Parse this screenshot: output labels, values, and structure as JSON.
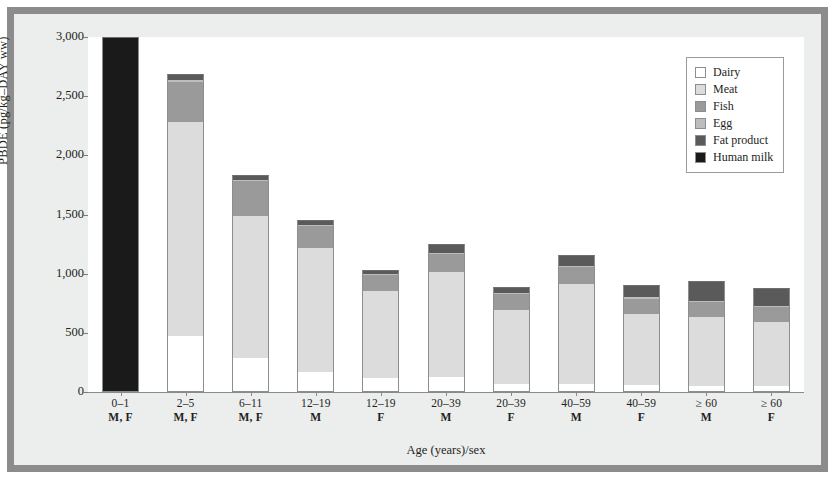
{
  "chart_data": {
    "type": "bar",
    "subtype": "stacked-bar",
    "title": "",
    "xlabel": "Age (years)/sex",
    "ylabel": "PBDE (pg/kg–DAY ww)",
    "ylim": [
      0,
      3000
    ],
    "yticks": [
      0,
      500,
      1000,
      1500,
      2000,
      2500,
      3000
    ],
    "ytick_labels": [
      "0",
      "500",
      "1,000",
      "1,500",
      "2,000",
      "2,500",
      "3,000"
    ],
    "grid": false,
    "legend_position": "top-right",
    "categories": [
      {
        "age": "0–1",
        "sex": "M, F"
      },
      {
        "age": "2–5",
        "sex": "M, F"
      },
      {
        "age": "6–11",
        "sex": "M, F"
      },
      {
        "age": "12–19",
        "sex": "M"
      },
      {
        "age": "12–19",
        "sex": "F"
      },
      {
        "age": "20–39",
        "sex": "M"
      },
      {
        "age": "20–39",
        "sex": "F"
      },
      {
        "age": "40–59",
        "sex": "M"
      },
      {
        "age": "40–59",
        "sex": "F"
      },
      {
        "age": "≥ 60",
        "sex": "M"
      },
      {
        "age": "≥ 60",
        "sex": "F"
      }
    ],
    "series": [
      {
        "name": "Dairy",
        "color": "#ffffff",
        "values": [
          0,
          470,
          290,
          165,
          120,
          125,
          70,
          70,
          60,
          55,
          55
        ]
      },
      {
        "name": "Meat",
        "color": "#dcdcdc",
        "values": [
          0,
          1810,
          1200,
          1050,
          735,
          890,
          625,
          840,
          600,
          575,
          535
        ]
      },
      {
        "name": "Fish",
        "color": "#9a9a9a",
        "values": [
          0,
          340,
          290,
          185,
          130,
          150,
          130,
          145,
          130,
          130,
          130
        ]
      },
      {
        "name": "Egg",
        "color": "#bdbdbd",
        "values": [
          0,
          20,
          15,
          10,
          10,
          10,
          10,
          10,
          10,
          10,
          10
        ]
      },
      {
        "name": "Fat product",
        "color": "#5a5a5a",
        "values": [
          0,
          45,
          40,
          40,
          40,
          75,
          50,
          95,
          105,
          170,
          150
        ]
      },
      {
        "name": "Human milk",
        "color": "#1a1a1a",
        "values": [
          3000,
          0,
          0,
          0,
          0,
          0,
          0,
          0,
          0,
          0,
          0
        ]
      }
    ],
    "totals": [
      3000,
      2685,
      1835,
      1450,
      1035,
      1250,
      885,
      1160,
      905,
      940,
      880
    ]
  },
  "legend": {
    "items": [
      {
        "label": "Dairy",
        "color": "#ffffff",
        "swatch": "dairy-swatch"
      },
      {
        "label": "Meat",
        "color": "#dcdcdc",
        "swatch": "meat-swatch"
      },
      {
        "label": "Fish",
        "color": "#9a9a9a",
        "swatch": "fish-swatch"
      },
      {
        "label": "Egg",
        "color": "#bdbdbd",
        "swatch": "egg-swatch"
      },
      {
        "label": "Fat product",
        "color": "#5a5a5a",
        "swatch": "fat-product-swatch"
      },
      {
        "label": "Human milk",
        "color": "#1a1a1a",
        "swatch": "human-milk-swatch"
      }
    ]
  },
  "axes": {
    "y_title": "PBDE (pg/kg–DAY ww)",
    "x_title": "Age (years)/sex"
  },
  "colors": {
    "frame_border": "#8c8c8c",
    "page_background": "#eceded",
    "plot_background": "#ffffff",
    "axis": "#8a8a8a",
    "text": "#231f20"
  }
}
